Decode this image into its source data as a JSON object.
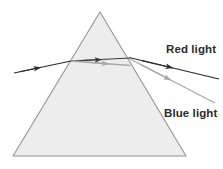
{
  "figure": {
    "type": "optics-ray-diagram",
    "width": 223,
    "height": 169,
    "background": "#ffffff"
  },
  "prism": {
    "name": "triangular-prism",
    "shape": "triangle",
    "apex": {
      "x": 100,
      "y": 12
    },
    "bottom_left": {
      "x": 13,
      "y": 156
    },
    "bottom_right": {
      "x": 186,
      "y": 156
    },
    "fill": "#ededed",
    "stroke": "#949494",
    "stroke_width": 1.1
  },
  "rays": {
    "incident": {
      "label": "incident-white-light",
      "color": "#2b2b2b",
      "from": {
        "x": 14,
        "y": 73
      },
      "to": {
        "x": 71,
        "y": 61
      },
      "arrow_at": {
        "x": 40,
        "y": 69
      }
    },
    "inside_red": {
      "label": "refracted-red-inside-prism",
      "color": "#3a3a3a",
      "from": {
        "x": 71,
        "y": 61
      },
      "to": {
        "x": 129,
        "y": 58
      },
      "arrow_at": {
        "x": 101,
        "y": 59
      }
    },
    "inside_blue": {
      "label": "refracted-blue-inside-prism",
      "color": "#a8a8a8",
      "from": {
        "x": 71,
        "y": 61
      },
      "to": {
        "x": 129,
        "y": 65
      },
      "arrow_at": {
        "x": 108,
        "y": 63
      }
    },
    "exit_red": {
      "label": "emergent-red-light",
      "color": "#2b2b2b",
      "from": {
        "x": 129,
        "y": 58
      },
      "to": {
        "x": 218,
        "y": 79
      },
      "arrow_at": {
        "x": 172,
        "y": 68
      }
    },
    "exit_blue": {
      "label": "emergent-blue-light",
      "color": "#a8a8a8",
      "from": {
        "x": 129,
        "y": 59
      },
      "to": {
        "x": 214,
        "y": 103
      },
      "arrow_at": {
        "x": 170,
        "y": 80
      }
    }
  },
  "labels": {
    "red_light": {
      "text": "Red light",
      "x": 166,
      "y": 53,
      "color": "#2b2b2b"
    },
    "blue_light": {
      "text": "Blue light",
      "x": 164,
      "y": 117,
      "color": "#2b2b2b"
    }
  }
}
